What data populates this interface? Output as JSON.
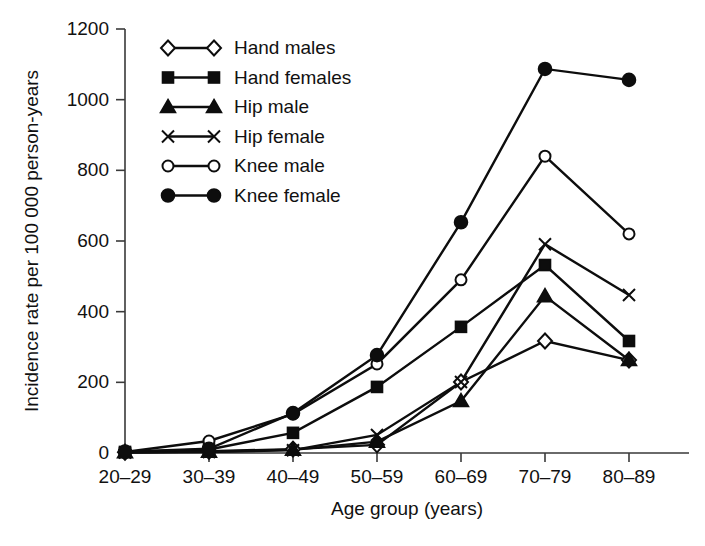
{
  "chart_data": {
    "type": "line",
    "title": "",
    "xlabel": "Age group (years)",
    "ylabel": "Incidence rate per 100 000 person-years",
    "categories": [
      "20–29",
      "30–39",
      "40–49",
      "50–59",
      "60–69",
      "70–79",
      "80–89"
    ],
    "ylim": [
      0,
      1200
    ],
    "yticks": [
      0,
      200,
      400,
      600,
      800,
      1000,
      1200
    ],
    "ytick_labels": [
      "0",
      "200",
      "400",
      "600",
      "800",
      "1000",
      "1200"
    ],
    "grid": false,
    "legend_position": "upper-left-inside",
    "series": [
      {
        "name": "Hand males",
        "marker": "open-diamond",
        "values": [
          2,
          5,
          11,
          23,
          201,
          317,
          263
        ]
      },
      {
        "name": "Hand females",
        "marker": "filled-square",
        "values": [
          3,
          10,
          57,
          187,
          357,
          532,
          317
        ]
      },
      {
        "name": "Hip male",
        "marker": "filled-triangle",
        "values": [
          2,
          4,
          9,
          32,
          147,
          444,
          263
        ]
      },
      {
        "name": "Hip female",
        "marker": "cross-x",
        "values": [
          1,
          3,
          8,
          51,
          201,
          591,
          447
        ]
      },
      {
        "name": "Knee male",
        "marker": "open-circle",
        "values": [
          3,
          34,
          110,
          252,
          490,
          840,
          620
        ]
      },
      {
        "name": "Knee female",
        "marker": "filled-circle",
        "values": [
          4,
          12,
          113,
          277,
          653,
          1087,
          1056
        ]
      }
    ]
  },
  "legend": {
    "items": [
      {
        "label": "Hand males"
      },
      {
        "label": "Hand females"
      },
      {
        "label": "Hip male"
      },
      {
        "label": "Hip female"
      },
      {
        "label": "Knee male"
      },
      {
        "label": "Knee female"
      }
    ]
  },
  "colors": {
    "ink": "#0d0d0d",
    "axis": "#3a3a3a",
    "background": "#ffffff"
  }
}
